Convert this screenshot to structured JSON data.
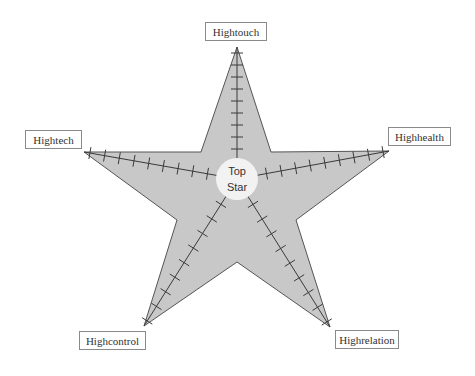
{
  "diagram": {
    "type": "star",
    "colors": {
      "star_fill": "#c8c8c8",
      "star_stroke": "#555555",
      "axis_stroke": "#3a3a3a",
      "center_fill": "#f2f2f2",
      "label_border": "#8a8a8a"
    },
    "center": {
      "line1": "Top",
      "line2": "Star"
    },
    "labels": {
      "top": "Hightouch",
      "left": "Hightech",
      "right": "Highhealth",
      "bottom_left": "Highcontrol",
      "bottom_right": "Highrelation"
    },
    "ticks_per_arm": 9
  }
}
